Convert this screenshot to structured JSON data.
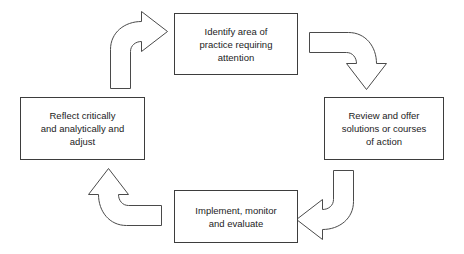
{
  "diagram": {
    "type": "cyclical-process",
    "direction": "clockwise",
    "stroke_color": "#3d3d3d",
    "fill_color": "#ffffff",
    "text_color": "#1c1c1c",
    "background": "#ffffff",
    "nodes": [
      {
        "id": "identify",
        "label": "Identify area of\npractice requiring\nattention",
        "position": "top"
      },
      {
        "id": "review",
        "label": "Review and offer\nsolutions or courses\nof action",
        "position": "right"
      },
      {
        "id": "implement",
        "label": "Implement, monitor\nand evaluate",
        "position": "bottom"
      },
      {
        "id": "reflect",
        "label": "Reflect critically\nand analytically and\nadjust",
        "position": "left"
      }
    ],
    "arrows": [
      {
        "id": "arrow-identify-to-review",
        "from": "identify",
        "to": "review",
        "shape": "curved-block-arrow",
        "points": "right-then-down"
      },
      {
        "id": "arrow-review-to-implement",
        "from": "review",
        "to": "implement",
        "shape": "curved-block-arrow",
        "points": "down-then-left"
      },
      {
        "id": "arrow-implement-to-reflect",
        "from": "implement",
        "to": "reflect",
        "shape": "curved-block-arrow",
        "points": "left-then-up"
      },
      {
        "id": "arrow-reflect-to-identify",
        "from": "reflect",
        "to": "identify",
        "shape": "curved-block-arrow",
        "points": "up-then-right"
      }
    ]
  }
}
